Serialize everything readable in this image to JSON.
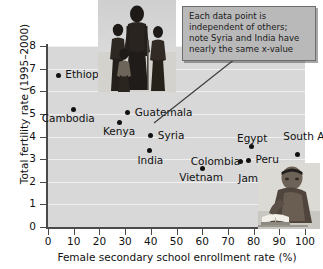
{
  "chart_data": {
    "type": "scatter",
    "title": "",
    "xlabel": "Female secondary school enrollment rate (%)",
    "ylabel": "Total fertility rate (1995–2000)",
    "xlim": [
      0,
      100
    ],
    "ylim": [
      0,
      8
    ],
    "xticks": [
      0,
      10,
      20,
      30,
      40,
      50,
      60,
      70,
      80,
      90,
      100
    ],
    "yticks": [
      0,
      1,
      2,
      3,
      4,
      5,
      6,
      7,
      8
    ],
    "grid": "horizontal",
    "legend": "none",
    "plot_background": "#d8d8d8",
    "marker_color": "#111111",
    "points": [
      {
        "label": "Ethiopia",
        "x": 4,
        "y": 6.7,
        "label_dx": 7,
        "label_dy": -6
      },
      {
        "label": "Cambodia",
        "x": 10,
        "y": 5.2,
        "label_dx": -32,
        "label_dy": 4
      },
      {
        "label": "Guatemala",
        "x": 31,
        "y": 5.05,
        "label_dx": 7,
        "label_dy": -6
      },
      {
        "label": "Kenya",
        "x": 28,
        "y": 4.62,
        "label_dx": -17,
        "label_dy": 4
      },
      {
        "label": "Syria",
        "x": 40,
        "y": 4.05,
        "label_dx": 7,
        "label_dy": -5
      },
      {
        "label": "India",
        "x": 39.5,
        "y": 3.38,
        "label_dx": -12,
        "label_dy": 4
      },
      {
        "label": "Egypt",
        "x": 79,
        "y": 3.55,
        "label_dx": -14,
        "label_dy": -14
      },
      {
        "label": "South Africa",
        "x": 97,
        "y": 3.2,
        "label_dx": -14,
        "label_dy": -24
      },
      {
        "label": "Peru",
        "x": 78,
        "y": 2.95,
        "label_dx": 7,
        "label_dy": -6
      },
      {
        "label": "Colombia",
        "x": 75,
        "y": 2.9,
        "label_dx": -50,
        "label_dy": -5
      },
      {
        "label": "Vietnam",
        "x": 60,
        "y": 2.6,
        "label_dx": -23,
        "label_dy": 4
      },
      {
        "label": "Jamaica",
        "x": 83,
        "y": 2.62,
        "label_dx": -23,
        "label_dy": 5
      }
    ],
    "annotations": [
      {
        "text": "Each data point is independent of others; note Syria and India have nearly the same x-value",
        "lines": [
          "Each data point is",
          "independent of others;",
          "note Syria and India have",
          "nearly the same x-value"
        ],
        "points_to": "Syria"
      }
    ],
    "images": [
      {
        "name": "family-photo",
        "description": "silhouette photograph of a mother with three children"
      },
      {
        "name": "reader-photo",
        "description": "photograph of a person reading a book"
      }
    ]
  }
}
